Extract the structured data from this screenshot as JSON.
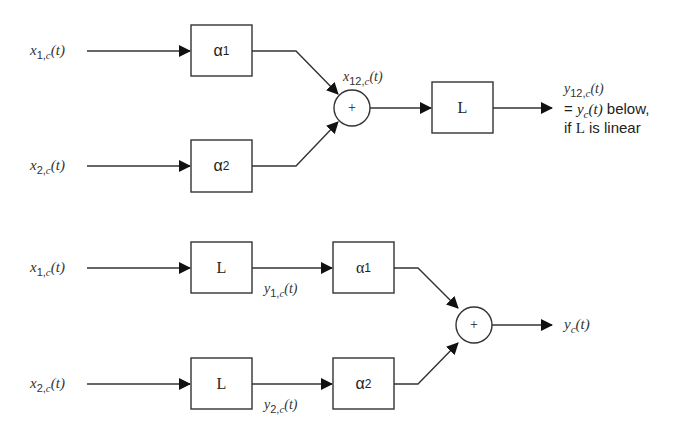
{
  "diagram": {
    "top": {
      "inputs": [
        {
          "var": "x",
          "sub": "1,",
          "subc": "c",
          "arg": "(t)"
        },
        {
          "var": "x",
          "sub": "2,",
          "subc": "c",
          "arg": "(t)"
        }
      ],
      "gains": [
        "α",
        "α"
      ],
      "gain_subs": [
        "1",
        "2"
      ],
      "sum_symbol": "+",
      "sum_label": {
        "var": "x",
        "sub": "12,",
        "subc": "c",
        "arg": "(t)"
      },
      "system": "L",
      "output": {
        "var": "y",
        "sub": "12,",
        "subc": "c",
        "arg": "(t)"
      },
      "output_note_line1_prefix": "= ",
      "output_note_line1_var": "y",
      "output_note_line1_sub": "c",
      "output_note_line1_arg": "(t)",
      "output_note_line1_suffix": " below,",
      "output_note_line2_prefix": "if ",
      "output_note_line2_L": "L",
      "output_note_line2_suffix": " is linear"
    },
    "bottom": {
      "inputs": [
        {
          "var": "x",
          "sub": "1,",
          "subc": "c",
          "arg": "(t)"
        },
        {
          "var": "x",
          "sub": "2,",
          "subc": "c",
          "arg": "(t)"
        }
      ],
      "systems": [
        "L",
        "L"
      ],
      "intermediate": [
        {
          "var": "y",
          "sub": "1,",
          "subc": "c",
          "arg": "(t)"
        },
        {
          "var": "y",
          "sub": "2,",
          "subc": "c",
          "arg": "(t)"
        }
      ],
      "gains": [
        "α",
        "α"
      ],
      "gain_subs": [
        "1",
        "2"
      ],
      "sum_symbol": "+",
      "output": {
        "var": "y",
        "sub": "",
        "subc": "c",
        "arg": "(t)"
      }
    }
  }
}
